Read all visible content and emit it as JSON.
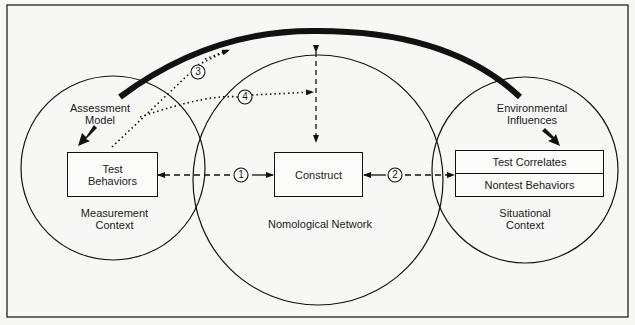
{
  "diagram": {
    "circles": {
      "measurement": {
        "label": "Measurement\nContext"
      },
      "nomological": {
        "label": "Nomological Network"
      },
      "situational": {
        "label": "Situational\nContext"
      }
    },
    "boxes": {
      "test_behaviors": "Test\nBehaviors",
      "construct": "Construct",
      "test_correlates": "Test Correlates",
      "nontest_behaviors": "Nontest Behaviors"
    },
    "influences": {
      "assessment_model": "Assessment\nModel",
      "environmental": "Environmental\nInfluences"
    },
    "paths": [
      "1",
      "2",
      "3",
      "4"
    ],
    "colors": {
      "ink": "#111111",
      "background": "#f7f7f5"
    }
  }
}
